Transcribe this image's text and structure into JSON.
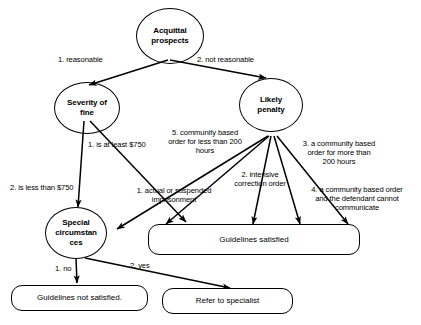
{
  "diagram": {
    "type": "flowchart",
    "stroke_color": "#000000",
    "background_color": "#ffffff"
  },
  "nodes": {
    "acquittal_prospects": {
      "label": "Acquittal\nprospects",
      "shape": "ellipse"
    },
    "severity_of_fine": {
      "label": "Severity of\nfine",
      "shape": "ellipse"
    },
    "likely_penalty": {
      "label": "Likely\npenalty",
      "shape": "ellipse"
    },
    "special_circumstances": {
      "label": "Special\ncircumstan\nces",
      "shape": "ellipse"
    },
    "guidelines_satisfied": {
      "label": "Guidelines satisfied",
      "shape": "rounded-rect"
    },
    "guidelines_not_satisfied": {
      "label": "Guidelines not satisfied.",
      "shape": "rounded-rect"
    },
    "refer_to_specialist": {
      "label": "Refer to specialist",
      "shape": "rounded-rect"
    }
  },
  "edge_labels": {
    "reasonable": "1. reasonable",
    "not_reasonable": "2. not reasonable",
    "at_least_750": "1. is at least $750",
    "less_than_750": "2. is less than $750",
    "community_based_less_200": "5. community based\norder for less than 200\nhours",
    "actual_or_suspended": "1. actual or suspended\nimprisonment",
    "intensive_correction": "2. intensive\ncorrection order",
    "community_based_more_200": "3. a community based\norder for more than\n200 hours",
    "community_based_no_contact": "4. a community based order\nand the defendant cannot\ncommunicate",
    "no": "1. no",
    "yes": "2. yes"
  }
}
